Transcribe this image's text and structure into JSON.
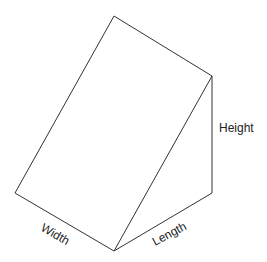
{
  "diagram": {
    "type": "triangular-prism",
    "line_color": "#333333",
    "text_color": "#222222",
    "background": "#ffffff",
    "vertices": {
      "top": [
        114,
        16
      ],
      "right_top": [
        212,
        76
      ],
      "right_bottom": [
        212,
        193
      ],
      "left": [
        15,
        193
      ],
      "bottom": [
        114,
        251
      ]
    },
    "labels": {
      "height": "Height",
      "width": "Width",
      "length": "Length"
    }
  }
}
